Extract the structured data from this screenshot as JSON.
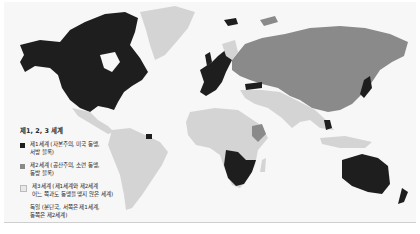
{
  "legend": {
    "title": "제1, 2, 3 세계",
    "items": [
      {
        "label": "제1세계 (자본주의, 미국 동맹,\n서방 블록)",
        "color": "#1e1e1e"
      },
      {
        "label": "제2세계 (공산주의, 소련 동맹,\n동방 블록)",
        "color": "#8a8a8a"
      },
      {
        "label": "제3세계 (제1세계와 제2세계\n어느 쪽과도 동맹을 맺지 않은 세계)",
        "color": "#d4d4d4"
      },
      {
        "label": "독일 (분단국, 서쪽은 제1세계,\n동쪽은 제2세계)",
        "color": "none"
      }
    ]
  },
  "colors": {
    "first_world": "#1e1e1e",
    "second_world": "#8a8a8a",
    "third_world": "#d4d4d4",
    "ocean": "#f7f7f7"
  }
}
